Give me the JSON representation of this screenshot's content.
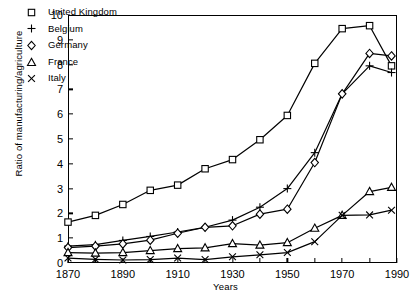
{
  "chart_data": {
    "type": "line",
    "title": "",
    "xlabel": "Years",
    "ylabel": "Ratio of manufacturing/agriculture",
    "xlim": [
      1870,
      1990
    ],
    "ylim": [
      0,
      10
    ],
    "xticks": [
      1870,
      1890,
      1910,
      1930,
      1950,
      1970,
      1990
    ],
    "yticks": [
      0,
      1,
      2,
      3,
      4,
      5,
      6,
      7,
      8,
      9,
      10
    ],
    "grid": false,
    "legend_position": "upper-left-inside",
    "series": [
      {
        "name": "United Kingdom",
        "marker": "square",
        "x": [
          1870,
          1880,
          1890,
          1900,
          1910,
          1920,
          1930,
          1940,
          1950,
          1960,
          1970,
          1980,
          1988
        ],
        "values": [
          1.65,
          1.92,
          2.36,
          2.93,
          3.14,
          3.8,
          4.17,
          4.97,
          5.95,
          8.05,
          9.45,
          9.57,
          7.95
        ]
      },
      {
        "name": "Belgium",
        "marker": "plus",
        "x": [
          1870,
          1880,
          1890,
          1900,
          1910,
          1920,
          1930,
          1940,
          1950,
          1960,
          1970,
          1980,
          1988
        ],
        "values": [
          0.68,
          0.74,
          0.91,
          1.07,
          1.25,
          1.44,
          1.73,
          2.25,
          3.0,
          4.45,
          6.82,
          7.95,
          7.68
        ]
      },
      {
        "name": "Germany",
        "marker": "diamond",
        "x": [
          1870,
          1880,
          1890,
          1900,
          1910,
          1920,
          1930,
          1940,
          1950,
          1960,
          1970,
          1980,
          1988
        ],
        "values": [
          0.62,
          0.68,
          0.77,
          0.92,
          1.2,
          1.44,
          1.5,
          1.97,
          2.17,
          4.05,
          6.82,
          8.45,
          8.35
        ]
      },
      {
        "name": "France",
        "marker": "triangle",
        "x": [
          1870,
          1880,
          1890,
          1900,
          1910,
          1920,
          1930,
          1940,
          1950,
          1960,
          1970,
          1980,
          1988
        ],
        "values": [
          0.42,
          0.4,
          0.42,
          0.5,
          0.58,
          0.61,
          0.78,
          0.72,
          0.82,
          1.4,
          1.92,
          2.88,
          3.05
        ]
      },
      {
        "name": "Italy",
        "marker": "x",
        "x": [
          1870,
          1880,
          1890,
          1900,
          1910,
          1920,
          1930,
          1940,
          1950,
          1960,
          1970,
          1980,
          1988
        ],
        "values": [
          0.2,
          0.15,
          0.12,
          0.14,
          0.2,
          0.14,
          0.25,
          0.33,
          0.42,
          0.86,
          1.92,
          1.94,
          2.13
        ]
      }
    ]
  },
  "legend": {
    "entries": [
      {
        "label": "United Kingdom",
        "marker": "square-marker"
      },
      {
        "label": "Belgium",
        "marker": "plus-marker"
      },
      {
        "label": "Germany",
        "marker": "diamond-marker"
      },
      {
        "label": "France",
        "marker": "triangle-marker"
      },
      {
        "label": "Italy",
        "marker": "x-marker"
      }
    ]
  },
  "axes": {
    "y_title": "Ratio of manufacturing/agriculture",
    "x_title": "Years"
  },
  "colors": {
    "ink": "#000000",
    "background": "#ffffff"
  }
}
